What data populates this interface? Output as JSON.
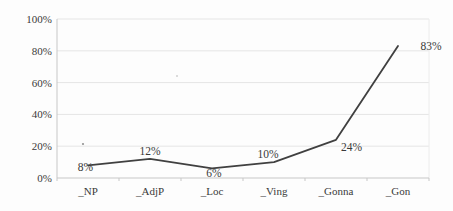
{
  "chart_data": {
    "type": "line",
    "categories": [
      "_NP",
      "_AdjP",
      "_Loc",
      "_Ving",
      "_Gonna",
      "_Gon"
    ],
    "values": [
      8,
      12,
      6,
      10,
      24,
      83
    ],
    "data_labels": [
      "8%",
      "12%",
      "6%",
      "10%",
      "24%",
      "83%"
    ],
    "title": "",
    "xlabel": "",
    "ylabel": "",
    "ylim": [
      0,
      100
    ],
    "ytick_step": 20,
    "ytick_labels": [
      "0%",
      "20%",
      "40%",
      "60%",
      "80%",
      "100%"
    ],
    "grid": true,
    "legend": "none",
    "line_color": "#404040",
    "grid_color": "#e5e5e5",
    "axis_color": "#c7c7c7",
    "right_border_color": "#ececec",
    "text_color": "#3a3a3a",
    "background_color": "#fdfdfd",
    "label_offsets": [
      {
        "dx": 5,
        "dy": 6,
        "anchor": "end"
      },
      {
        "dx": 0,
        "dy": -4,
        "anchor": "middle"
      },
      {
        "dx": 2,
        "dy": 9,
        "anchor": "middle"
      },
      {
        "dx": -6,
        "dy": -4,
        "anchor": "middle"
      },
      {
        "dx": 5,
        "dy": 11,
        "anchor": "start"
      },
      {
        "dx": 33,
        "dy": 4,
        "anchor": "middle"
      }
    ]
  }
}
